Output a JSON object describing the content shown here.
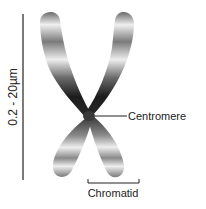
{
  "diagram": {
    "scale_label": "0.2 - 20µm",
    "centromere_label": "Centromere",
    "chromatid_label": "Chromatid",
    "colors": {
      "line": "#222222",
      "arm_dark": "#1a1a1a",
      "arm_light": "#f2f2f2",
      "arm_mid": "#8a8a8a"
    }
  }
}
